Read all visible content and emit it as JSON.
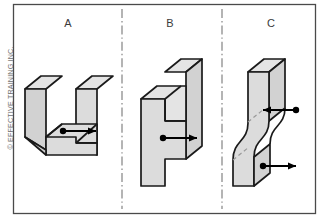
{
  "figure": {
    "type": "engineering-drawing",
    "copyright": "© EFFECTIVE TRAINING INC."
  },
  "frame": {
    "border_color": "#4a4a4a",
    "background_color": "#ffffff"
  },
  "style": {
    "face_fill": "#dcdcdc",
    "top_fill": "#e4e4e4",
    "side_fill": "#d2d2d2",
    "outline_color": "#1a1a1a",
    "hidden_line_color": "#9a9a9a",
    "annotation_color": "#000000",
    "divider_color": "#777777",
    "label_color": "#3b3b3b"
  },
  "dividers": [
    {
      "name": "divider-a-b",
      "x": 122,
      "style": "dash-dot"
    },
    {
      "name": "divider-b-c",
      "x": 222,
      "style": "dash-dot"
    }
  ],
  "panels": [
    {
      "id": "a",
      "label": "A",
      "label_x": 68,
      "label_y": 23,
      "shape": "u-channel-slot-block",
      "annotations": [
        {
          "name": "point-dot",
          "type": "dot",
          "x": 63,
          "y": 131
        },
        {
          "name": "direction-arrow",
          "type": "arrow",
          "direction": "right",
          "from_x": 63,
          "to_x": 96,
          "y": 131
        }
      ]
    },
    {
      "id": "b",
      "label": "B",
      "label_x": 170,
      "label_y": 23,
      "shape": "z-stepped-block",
      "annotations": [
        {
          "name": "point-dot",
          "type": "dot",
          "x": 163,
          "y": 138
        },
        {
          "name": "direction-arrow",
          "type": "arrow",
          "direction": "right",
          "from_x": 163,
          "to_x": 197,
          "y": 138
        }
      ]
    },
    {
      "id": "c",
      "label": "C",
      "label_x": 271,
      "label_y": 23,
      "shape": "s-curve-block",
      "annotations": [
        {
          "name": "point-dot-upper",
          "type": "dot",
          "x": 296,
          "y": 110
        },
        {
          "name": "direction-arrow-upper",
          "type": "arrow",
          "direction": "left",
          "from_x": 296,
          "to_x": 263,
          "y": 110
        },
        {
          "name": "point-dot-lower",
          "type": "dot",
          "x": 263,
          "y": 166
        },
        {
          "name": "direction-arrow-lower",
          "type": "arrow",
          "direction": "right",
          "from_x": 263,
          "to_x": 296,
          "y": 166
        }
      ]
    }
  ]
}
